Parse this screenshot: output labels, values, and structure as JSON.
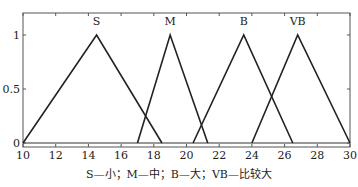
{
  "chart_data": {
    "type": "line",
    "title": "",
    "xlabel": "",
    "ylabel": "",
    "xlim": [
      10,
      30
    ],
    "ylim": [
      0,
      1.2
    ],
    "xticks": [
      10,
      12,
      14,
      16,
      18,
      20,
      22,
      24,
      26,
      28,
      30
    ],
    "yticks": [
      0,
      0.5,
      1
    ],
    "ytick_labels": [
      "0",
      "0.5",
      "1"
    ],
    "grid": false,
    "legend": "none",
    "series": [
      {
        "name": "S",
        "x": [
          10,
          14.5,
          18.5
        ],
        "y": [
          0,
          1,
          0
        ]
      },
      {
        "name": "M",
        "x": [
          17,
          19,
          21.3
        ],
        "y": [
          0,
          1,
          0
        ]
      },
      {
        "name": "B",
        "x": [
          20.4,
          23.5,
          26.5
        ],
        "y": [
          0,
          1,
          0
        ]
      },
      {
        "name": "VB",
        "x": [
          24,
          26.8,
          30
        ],
        "y": [
          0,
          1,
          0
        ]
      }
    ],
    "caption": "S—小；M—中；B—大；VB—比较大"
  },
  "colors": {
    "line": "#222222",
    "axis": "#555555"
  }
}
